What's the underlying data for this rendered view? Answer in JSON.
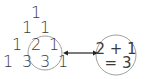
{
  "triangle": {
    "rows": [
      [
        "1"
      ],
      [
        "1",
        "1"
      ],
      [
        "1",
        "2",
        "1"
      ],
      [
        "1",
        "3",
        "3",
        "1"
      ]
    ]
  },
  "highlight": {
    "equation_line1": "2 + 1",
    "equation_line2": "= 3"
  },
  "colors": {
    "text": "#3a3a3a",
    "circle": "#a0a0a0",
    "arrow": "#222222"
  }
}
